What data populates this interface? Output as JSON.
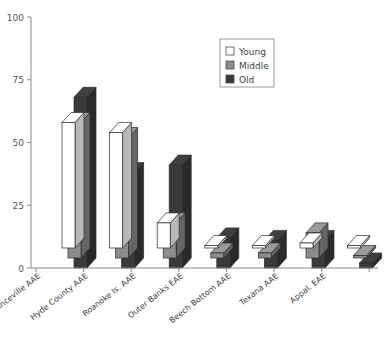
{
  "chart_data": {
    "type": "bar",
    "title": "",
    "subtitle": "",
    "xlabel": "",
    "ylabel": "",
    "ylim": [
      0,
      100
    ],
    "yticks": [
      0,
      25,
      50,
      75,
      100
    ],
    "grid": false,
    "style": "3d-grouped-bar",
    "legend_position": "top-right",
    "categories": [
      "Princeville AAE",
      "Hyde County AAE",
      "Roanoke Is. AAE",
      "Outer Banks EAE",
      "Beech Bottom AAE",
      "Texana AAE",
      "Appal. EAE"
    ],
    "series": [
      {
        "name": "Young",
        "color": "#ffffff",
        "values": [
          50,
          46,
          10,
          1,
          1,
          2,
          1
        ]
      },
      {
        "name": "Middle",
        "color": "#8c8c8c",
        "values": [
          54,
          48,
          14,
          2,
          2,
          10,
          1
        ]
      },
      {
        "name": "Old",
        "color": "#3a3a3a",
        "values": [
          68,
          38,
          41,
          12,
          11,
          11,
          2
        ]
      }
    ]
  },
  "axis": {
    "y_tick_labels": [
      "0",
      "25",
      "50",
      "75",
      "100"
    ],
    "axis_color": "#8a8a8a"
  },
  "legend": {
    "entries": [
      {
        "label": "Young",
        "swatch": "#ffffff"
      },
      {
        "label": "Middle",
        "swatch": "#8c8c8c"
      },
      {
        "label": "Old",
        "swatch": "#3a3a3a"
      }
    ],
    "border_color": "#9a9a9a"
  }
}
